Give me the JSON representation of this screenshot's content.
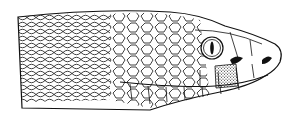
{
  "image": {
    "subject": "Line drawing of a pit viper snake head in profile, facing right",
    "alt": "Snake head illustration",
    "colors": {
      "ink": "#111111",
      "background": "#ffffff"
    }
  }
}
